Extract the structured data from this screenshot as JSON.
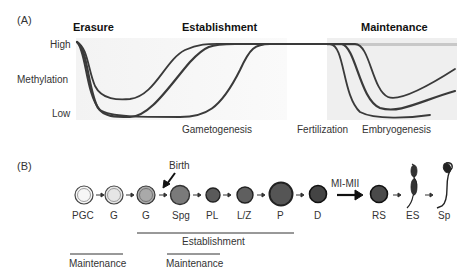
{
  "panel_a": {
    "label": "(A)",
    "stages": [
      "Erasure",
      "Establishment",
      "Maintenance"
    ],
    "y_axis": {
      "high": "High",
      "title": "Methylation",
      "low": "Low"
    },
    "x_labels": [
      "Gametogenesis",
      "Fertilization",
      "Embryogenesis"
    ]
  },
  "panel_b": {
    "label": "(B)",
    "birth_label": "Birth",
    "meiosis_label": "MI-MII",
    "cells": [
      {
        "label": "PGC",
        "fill": "#f6f6f6"
      },
      {
        "label": "G",
        "fill": "#e6e6e6"
      },
      {
        "label": "G",
        "fill": "#a9a9a9"
      },
      {
        "label": "Spg",
        "fill": "#7a7a7a"
      },
      {
        "label": "PL",
        "fill": "#5a5a5a"
      },
      {
        "label": "L/Z",
        "fill": "#5f5f5f"
      },
      {
        "label": "P",
        "fill": "#555555"
      },
      {
        "label": "D",
        "fill": "#444444"
      },
      {
        "label": "RS",
        "fill": "#4a4a4a"
      },
      {
        "label": "ES",
        "fill": "#333333"
      },
      {
        "label": "Sp",
        "fill": "#222222"
      }
    ],
    "brackets": {
      "establishment": "Establishment",
      "maintenance_1": "Maintenance",
      "maintenance_2": "Maintenance"
    }
  }
}
